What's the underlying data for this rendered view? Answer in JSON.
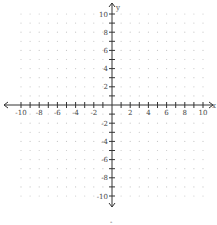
{
  "chart_data": {
    "type": "scatter",
    "title": "",
    "xlabel": "x",
    "ylabel": "y",
    "xlim": [
      -10,
      10
    ],
    "ylim": [
      -10,
      10
    ],
    "grid": "dotted",
    "x_ticks": [
      -10,
      -8,
      -6,
      -4,
      -2,
      2,
      4,
      6,
      8,
      10
    ],
    "y_ticks": [
      10,
      8,
      6,
      4,
      2,
      -2,
      -4,
      -6,
      -8,
      -10
    ],
    "x_tick_labels": [
      "-10",
      "-8",
      "-6",
      "-4",
      "-2",
      "2",
      "4",
      "6",
      "8",
      "10"
    ],
    "y_tick_labels": [
      "10",
      "8",
      "6",
      "4",
      "2",
      "-2",
      "-4",
      "-6",
      "-8",
      "-10"
    ],
    "series": [],
    "colors": {
      "axis": "#333333",
      "grid_dot": "#c8c8c8",
      "label": "#444444"
    }
  },
  "below_mark": "-"
}
